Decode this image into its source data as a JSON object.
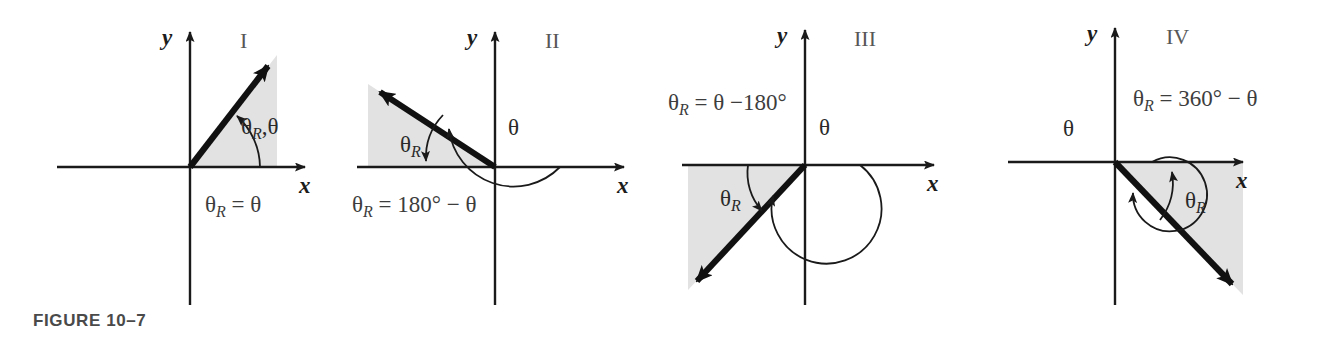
{
  "figure": {
    "caption": "FIGURE 10–7",
    "background_color": "#ffffff",
    "shade_color": "#e2e2e2",
    "line_color": "#1a1a1a",
    "text_color": "#3a3a3a"
  },
  "axes": {
    "x_label": "x",
    "y_label": "y"
  },
  "panels": [
    {
      "quadrant_label": "I",
      "angle_annotation": "θR,θ",
      "angle_annotation_base": "θ",
      "angle_annotation_sub": "R",
      "angle_annotation_tail": ",θ",
      "formula_base": "θ",
      "formula_sub": "R",
      "formula_tail": " = θ",
      "formula_full": "θR = θ",
      "theta_label": "",
      "ray_direction": "up-right",
      "shaded_region": "triangle-quadrant-1"
    },
    {
      "quadrant_label": "II",
      "angle_annotation": "θR",
      "angle_annotation_base": "θ",
      "angle_annotation_sub": "R",
      "angle_annotation_tail": "",
      "formula_base": "θ",
      "formula_sub": "R",
      "formula_tail": " = 180° − θ",
      "formula_full": "θR = 180° − θ",
      "theta_label": "θ",
      "ray_direction": "up-left",
      "shaded_region": "triangle-quadrant-2"
    },
    {
      "quadrant_label": "III",
      "angle_annotation": "θR",
      "angle_annotation_base": "θ",
      "angle_annotation_sub": "R",
      "angle_annotation_tail": "",
      "formula_base": "θ",
      "formula_sub": "R",
      "formula_tail": " = θ −180°",
      "formula_full": "θR = θ −180°",
      "theta_label": "θ",
      "ray_direction": "down-left",
      "shaded_region": "triangle-quadrant-3"
    },
    {
      "quadrant_label": "IV",
      "angle_annotation": "θR",
      "angle_annotation_base": "θ",
      "angle_annotation_sub": "R",
      "angle_annotation_tail": "",
      "formula_base": "θ",
      "formula_sub": "R",
      "formula_tail": " = 360° − θ",
      "formula_full": "θR = 360° − θ",
      "theta_label": "θ",
      "ray_direction": "down-right",
      "shaded_region": "triangle-quadrant-4"
    }
  ]
}
